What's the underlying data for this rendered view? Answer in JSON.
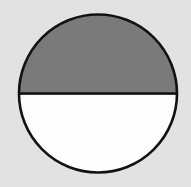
{
  "figure": {
    "name": "half-shaded-circle",
    "canvas": {
      "width": 191,
      "height": 187,
      "background_color": "#e2e2e2"
    },
    "circle": {
      "center_x": 98,
      "center_y": 93.5,
      "radius": 79,
      "stroke_color": "#121212",
      "stroke_width": 2.6
    },
    "divider": {
      "label": "horizontal-diameter",
      "x1": 19,
      "y1": 93.5,
      "x2": 177,
      "y2": 93.5,
      "stroke_color": "#121212",
      "stroke_width": 2.6
    },
    "regions": [
      {
        "label": "upper-semicircle",
        "shaded": true,
        "fill_color": "#7a7a7a",
        "fraction": 0.5
      },
      {
        "label": "lower-semicircle",
        "shaded": false,
        "fill_color": "#fdfdfd",
        "fraction": 0.5
      }
    ]
  },
  "chart_data": {
    "type": "pie",
    "title": "",
    "categories": [
      "Shaded (upper half)",
      "Unshaded (lower half)"
    ],
    "values": [
      50,
      50
    ],
    "colors": [
      "#7a7a7a",
      "#fdfdfd"
    ],
    "legend": "none",
    "grid": false,
    "annotations": []
  }
}
